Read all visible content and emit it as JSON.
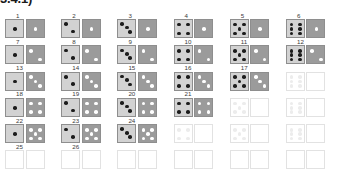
{
  "heading": "3.4.1)",
  "legend": {
    "light_die_label": "first-die",
    "dark_die_label": "second-die"
  },
  "grid": {
    "columns": 6,
    "rows": 6,
    "cells": [
      {
        "label": "1",
        "light": 1,
        "dark": 1,
        "ghost": false
      },
      {
        "label": "2",
        "light": 2,
        "dark": 1,
        "ghost": false
      },
      {
        "label": "3",
        "light": 3,
        "dark": 1,
        "ghost": false
      },
      {
        "label": "4",
        "light": 4,
        "dark": 1,
        "ghost": false
      },
      {
        "label": "5",
        "light": 5,
        "dark": 1,
        "ghost": false
      },
      {
        "label": "6",
        "light": 6,
        "dark": 1,
        "ghost": false
      },
      {
        "label": "7",
        "light": 1,
        "dark": 2,
        "ghost": false
      },
      {
        "label": "8",
        "light": 2,
        "dark": 2,
        "ghost": false
      },
      {
        "label": "9",
        "light": 3,
        "dark": 2,
        "ghost": false
      },
      {
        "label": "10",
        "light": 4,
        "dark": 2,
        "ghost": false
      },
      {
        "label": "11",
        "light": 5,
        "dark": 2,
        "ghost": false
      },
      {
        "label": "12",
        "light": 6,
        "dark": 2,
        "ghost": false
      },
      {
        "label": "13",
        "light": 1,
        "dark": 3,
        "ghost": false
      },
      {
        "label": "14",
        "light": 2,
        "dark": 3,
        "ghost": false
      },
      {
        "label": "15",
        "light": 3,
        "dark": 3,
        "ghost": false
      },
      {
        "label": "16",
        "light": 4,
        "dark": 3,
        "ghost": false
      },
      {
        "label": "17",
        "light": 5,
        "dark": 3,
        "ghost": false
      },
      {
        "label": "",
        "light": 6,
        "dark": 0,
        "ghost": true
      },
      {
        "label": "18",
        "light": 1,
        "dark": 4,
        "ghost": false
      },
      {
        "label": "19",
        "light": 2,
        "dark": 4,
        "ghost": false
      },
      {
        "label": "20",
        "light": 3,
        "dark": 4,
        "ghost": false
      },
      {
        "label": "21",
        "light": 4,
        "dark": 4,
        "ghost": false
      },
      {
        "label": "",
        "light": 5,
        "dark": 0,
        "ghost": true
      },
      {
        "label": "",
        "light": 6,
        "dark": 0,
        "ghost": true
      },
      {
        "label": "22",
        "light": 1,
        "dark": 5,
        "ghost": false
      },
      {
        "label": "23",
        "light": 2,
        "dark": 5,
        "ghost": false
      },
      {
        "label": "24",
        "light": 3,
        "dark": 5,
        "ghost": false
      },
      {
        "label": "",
        "light": 4,
        "dark": 0,
        "ghost": true
      },
      {
        "label": "",
        "light": 5,
        "dark": 0,
        "ghost": true
      },
      {
        "label": "",
        "light": 6,
        "dark": 0,
        "ghost": true
      },
      {
        "label": "25",
        "light": 0,
        "dark": 0,
        "ghost": true
      },
      {
        "label": "26",
        "light": 0,
        "dark": 0,
        "ghost": true
      },
      {
        "label": "",
        "light": 0,
        "dark": 0,
        "ghost": true
      },
      {
        "label": "",
        "light": 0,
        "dark": 0,
        "ghost": true
      },
      {
        "label": "",
        "light": 0,
        "dark": 0,
        "ghost": true
      },
      {
        "label": "",
        "light": 0,
        "dark": 0,
        "ghost": true
      }
    ]
  },
  "colors": {
    "light_die_face": "#d2d2d2",
    "dark_die_face": "#9b9b9b",
    "die_border": "#8e8e8e",
    "light_pip": "#1c1c1c",
    "dark_pip": "#ffffff",
    "ghost_border": "#e2e2e2",
    "ghost_pip": "#ececec",
    "label_text": "#3b3b3b",
    "heading_text": "#1a1a1a",
    "background": "#ffffff"
  }
}
